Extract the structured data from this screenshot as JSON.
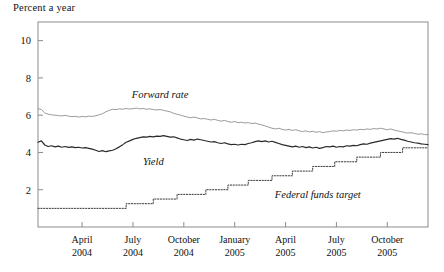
{
  "chart_data": {
    "type": "line",
    "title": "Percent a year",
    "xlabel": "",
    "ylabel": "Percent a year",
    "ylim": [
      0,
      11
    ],
    "yticks": [
      2,
      4,
      6,
      8,
      10
    ],
    "ytick_labels": [
      "2",
      "4",
      "6",
      "8",
      "10"
    ],
    "grid": false,
    "legend": "inline-annotations",
    "x_tick_labels": [
      {
        "month": "April",
        "year": "2004"
      },
      {
        "month": "July",
        "year": "2004"
      },
      {
        "month": "October",
        "year": "2004"
      },
      {
        "month": "January",
        "year": "2005"
      },
      {
        "month": "April",
        "year": "2005"
      },
      {
        "month": "July",
        "year": "2005"
      },
      {
        "month": "October",
        "year": "2005"
      }
    ],
    "x_tick_positions_months": [
      3,
      6,
      9,
      12,
      15,
      18,
      21
    ],
    "x_range_months": [
      0.4,
      23.4
    ],
    "annotations": [
      {
        "text": "Forward rate",
        "x_month": 7.6,
        "y_value": 6.9
      },
      {
        "text": "Yield",
        "x_month": 7.2,
        "y_value": 3.35
      },
      {
        "text": "Federal funds target",
        "x_month": 16.9,
        "y_value": 1.55
      }
    ],
    "series": [
      {
        "name": "Forward rate",
        "color": "#9a9a9a",
        "style": "solid",
        "width": 1.0,
        "x": [
          0.4,
          0.6,
          0.8,
          1.0,
          1.2,
          1.4,
          1.6,
          1.8,
          2.0,
          2.2,
          2.4,
          2.6,
          2.8,
          3.0,
          3.2,
          3.4,
          3.6,
          3.8,
          4.0,
          4.2,
          4.4,
          4.6,
          4.8,
          5.0,
          5.2,
          5.4,
          5.6,
          5.8,
          6.0,
          6.2,
          6.4,
          6.6,
          6.8,
          7.0,
          7.2,
          7.4,
          7.6,
          7.8,
          8.0,
          8.2,
          8.4,
          8.6,
          8.8,
          9.0,
          9.2,
          9.4,
          9.6,
          9.8,
          10.0,
          10.2,
          10.4,
          10.6,
          10.8,
          11.0,
          11.2,
          11.4,
          11.6,
          11.8,
          12.0,
          12.2,
          12.4,
          12.6,
          12.8,
          13.0,
          13.2,
          13.4,
          13.6,
          13.8,
          14.0,
          14.2,
          14.4,
          14.6,
          14.8,
          15.0,
          15.2,
          15.4,
          15.6,
          15.8,
          16.0,
          16.2,
          16.4,
          16.6,
          16.8,
          17.0,
          17.2,
          17.4,
          17.6,
          17.8,
          18.0,
          18.2,
          18.4,
          18.6,
          18.8,
          19.0,
          19.2,
          19.4,
          19.6,
          19.8,
          20.0,
          20.2,
          20.4,
          20.6,
          20.8,
          21.0,
          21.2,
          21.4,
          21.6,
          21.8,
          22.0,
          22.2,
          22.4,
          22.6,
          22.8,
          23.0,
          23.2,
          23.4
        ],
        "y": [
          6.35,
          6.3,
          6.12,
          6.05,
          6.02,
          6.0,
          5.98,
          5.96,
          5.99,
          5.95,
          5.92,
          5.94,
          5.9,
          5.93,
          5.91,
          5.95,
          5.93,
          5.97,
          6.02,
          6.08,
          6.18,
          6.26,
          6.32,
          6.3,
          6.34,
          6.32,
          6.36,
          6.33,
          6.35,
          6.38,
          6.34,
          6.36,
          6.32,
          6.34,
          6.3,
          6.28,
          6.3,
          6.26,
          6.22,
          6.18,
          6.1,
          6.05,
          6.0,
          5.95,
          5.9,
          5.86,
          5.9,
          5.85,
          5.8,
          5.82,
          5.78,
          5.74,
          5.78,
          5.72,
          5.68,
          5.72,
          5.66,
          5.62,
          5.66,
          5.6,
          5.62,
          5.58,
          5.6,
          5.55,
          5.58,
          5.52,
          5.48,
          5.42,
          5.36,
          5.3,
          5.26,
          5.3,
          5.24,
          5.2,
          5.24,
          5.18,
          5.22,
          5.16,
          5.12,
          5.16,
          5.1,
          5.14,
          5.08,
          5.12,
          5.06,
          5.1,
          5.12,
          5.16,
          5.14,
          5.18,
          5.16,
          5.2,
          5.18,
          5.22,
          5.2,
          5.24,
          5.22,
          5.26,
          5.24,
          5.28,
          5.26,
          5.3,
          5.26,
          5.22,
          5.26,
          5.2,
          5.16,
          5.12,
          5.08,
          5.04,
          5.06,
          5.02,
          4.98,
          5.0,
          4.96,
          4.95
        ]
      },
      {
        "name": "Yield",
        "color": "#2a2a2a",
        "style": "solid",
        "width": 1.2,
        "x": [
          0.4,
          0.6,
          0.8,
          1.0,
          1.2,
          1.4,
          1.6,
          1.8,
          2.0,
          2.2,
          2.4,
          2.6,
          2.8,
          3.0,
          3.2,
          3.4,
          3.6,
          3.8,
          4.0,
          4.2,
          4.4,
          4.6,
          4.8,
          5.0,
          5.2,
          5.4,
          5.6,
          5.8,
          6.0,
          6.2,
          6.4,
          6.6,
          6.8,
          7.0,
          7.2,
          7.4,
          7.6,
          7.8,
          8.0,
          8.2,
          8.4,
          8.6,
          8.8,
          9.0,
          9.2,
          9.4,
          9.6,
          9.8,
          10.0,
          10.2,
          10.4,
          10.6,
          10.8,
          11.0,
          11.2,
          11.4,
          11.6,
          11.8,
          12.0,
          12.2,
          12.4,
          12.6,
          12.8,
          13.0,
          13.2,
          13.4,
          13.6,
          13.8,
          14.0,
          14.2,
          14.4,
          14.6,
          14.8,
          15.0,
          15.2,
          15.4,
          15.6,
          15.8,
          16.0,
          16.2,
          16.4,
          16.6,
          16.8,
          17.0,
          17.2,
          17.4,
          17.6,
          17.8,
          18.0,
          18.2,
          18.4,
          18.6,
          18.8,
          19.0,
          19.2,
          19.4,
          19.6,
          19.8,
          20.0,
          20.2,
          20.4,
          20.6,
          20.8,
          21.0,
          21.2,
          21.4,
          21.6,
          21.8,
          22.0,
          22.2,
          22.4,
          22.6,
          22.8,
          23.0,
          23.2,
          23.4
        ],
        "y": [
          4.55,
          4.62,
          4.4,
          4.32,
          4.36,
          4.3,
          4.34,
          4.28,
          4.32,
          4.27,
          4.3,
          4.26,
          4.28,
          4.24,
          4.26,
          4.22,
          4.18,
          4.12,
          4.05,
          4.1,
          4.04,
          4.08,
          4.12,
          4.2,
          4.3,
          4.42,
          4.55,
          4.62,
          4.7,
          4.76,
          4.8,
          4.84,
          4.82,
          4.86,
          4.84,
          4.88,
          4.86,
          4.9,
          4.86,
          4.82,
          4.84,
          4.78,
          4.72,
          4.68,
          4.64,
          4.7,
          4.66,
          4.72,
          4.68,
          4.64,
          4.6,
          4.56,
          4.58,
          4.52,
          4.48,
          4.52,
          4.46,
          4.42,
          4.44,
          4.4,
          4.44,
          4.42,
          4.48,
          4.52,
          4.58,
          4.62,
          4.58,
          4.62,
          4.56,
          4.6,
          4.54,
          4.48,
          4.42,
          4.38,
          4.34,
          4.3,
          4.34,
          4.28,
          4.32,
          4.26,
          4.3,
          4.24,
          4.28,
          4.22,
          4.26,
          4.32,
          4.3,
          4.34,
          4.28,
          4.32,
          4.3,
          4.36,
          4.34,
          4.38,
          4.36,
          4.42,
          4.46,
          4.44,
          4.5,
          4.54,
          4.58,
          4.62,
          4.66,
          4.7,
          4.74,
          4.72,
          4.76,
          4.7,
          4.66,
          4.6,
          4.56,
          4.52,
          4.5,
          4.46,
          4.44,
          4.42
        ]
      },
      {
        "name": "Federal funds target",
        "color": "#3a3a3a",
        "style": "dotted",
        "width": 1.0,
        "step": true,
        "x": [
          0.4,
          5.6,
          5.6,
          7.2,
          7.2,
          8.6,
          8.6,
          10.3,
          10.3,
          11.6,
          11.6,
          12.8,
          12.8,
          14.2,
          14.2,
          15.4,
          15.4,
          16.6,
          16.6,
          17.9,
          17.9,
          19.2,
          19.2,
          20.6,
          20.6,
          21.9,
          21.9,
          23.4
        ],
        "y": [
          1.0,
          1.0,
          1.25,
          1.25,
          1.5,
          1.5,
          1.75,
          1.75,
          2.0,
          2.0,
          2.25,
          2.25,
          2.5,
          2.5,
          2.75,
          2.75,
          3.0,
          3.0,
          3.25,
          3.25,
          3.5,
          3.5,
          3.75,
          3.75,
          4.0,
          4.0,
          4.25,
          4.25
        ]
      }
    ]
  }
}
